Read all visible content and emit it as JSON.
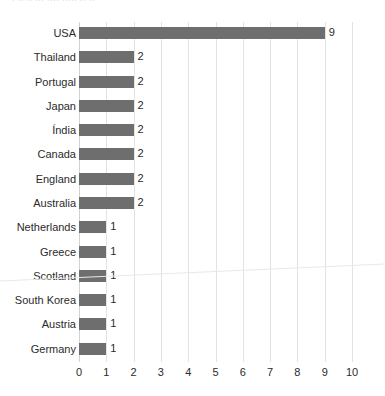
{
  "title_remnant": "· ·· ·· ··· ···· ····· ·· ··",
  "colors": {
    "bar": "#6e6e6e",
    "gridline": "#e3e3e3",
    "axis": "#d2d2d2",
    "text": "#2b2b2b",
    "background": "#ffffff"
  },
  "chart_data": {
    "type": "bar",
    "orientation": "horizontal",
    "title": "",
    "xlabel": "",
    "ylabel": "",
    "xlim": [
      0,
      10
    ],
    "grid": true,
    "legend": false,
    "xticks": [
      "0",
      "1",
      "2",
      "3",
      "4",
      "5",
      "6",
      "7",
      "8",
      "9",
      "10"
    ],
    "categories": [
      "USA",
      "Thailand",
      "Portugal",
      "Japan",
      "Índia",
      "Canada",
      "England",
      "Australia",
      "Netherlands",
      "Greece",
      "Scotland",
      "South Korea",
      "Austria",
      "Germany"
    ],
    "values": [
      9,
      2,
      2,
      2,
      2,
      2,
      2,
      2,
      1,
      1,
      1,
      1,
      1,
      1
    ],
    "data_labels": [
      "9",
      "2",
      "2",
      "2",
      "2",
      "2",
      "2",
      "2",
      "1",
      "1",
      "1",
      "1",
      "1",
      "1"
    ]
  }
}
